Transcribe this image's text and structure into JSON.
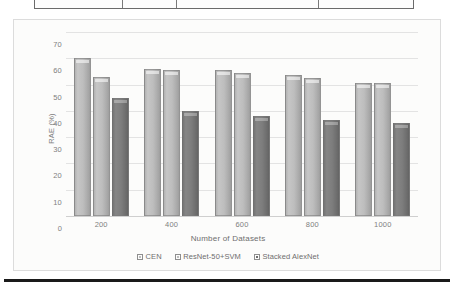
{
  "figure": {
    "frame_visible": true,
    "background_color": "#fcfcfb"
  },
  "page_artifacts": {
    "top_table_fragment_visible": true,
    "bottom_rule_visible": true,
    "rule_color": "#1a1a1a"
  },
  "chart_data": {
    "type": "bar",
    "title": "",
    "xlabel": "Number of Datasets",
    "ylabel": "RAE (%)",
    "categories": [
      "200",
      "400",
      "600",
      "800",
      "1000"
    ],
    "series": [
      {
        "name": "CEN",
        "color": "#bdbdbd",
        "values": [
          60,
          56,
          55.5,
          53.5,
          50.5
        ]
      },
      {
        "name": "ResNet-50+SVM",
        "color": "#bdbdbd",
        "values": [
          53,
          55.5,
          54.5,
          52.5,
          50.5
        ]
      },
      {
        "name": "Stacked AlexNet",
        "color": "#6f6f6f",
        "values": [
          45,
          40,
          38,
          36.5,
          35.5
        ]
      }
    ],
    "ylim": [
      0,
      70
    ],
    "yticks": [
      0,
      10,
      20,
      30,
      40,
      50,
      60,
      70
    ],
    "ytick_labels": [
      "0",
      "10",
      "20",
      "30",
      "40",
      "50",
      "60",
      "70"
    ],
    "grid": true,
    "grid_axis": "y",
    "legend_position": "bottom-center"
  }
}
